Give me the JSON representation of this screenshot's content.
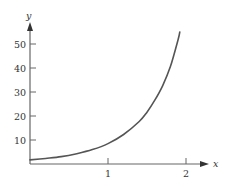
{
  "chart_data": {
    "type": "line",
    "title": "",
    "xlabel": "x",
    "ylabel": "y",
    "xlim": [
      0,
      2.2
    ],
    "ylim": [
      0,
      58
    ],
    "grid": false,
    "legend": null,
    "x_ticks": [
      {
        "value": 1,
        "label": "1"
      },
      {
        "value": 2,
        "label": "2"
      }
    ],
    "y_ticks": [
      {
        "value": 10,
        "label": "10"
      },
      {
        "value": 20,
        "label": "20"
      },
      {
        "value": 30,
        "label": "30"
      },
      {
        "value": 40,
        "label": "40"
      },
      {
        "value": 50,
        "label": "50"
      }
    ],
    "series": [
      {
        "name": "curve",
        "color": "#555555",
        "x": [
          0,
          0.2,
          0.4,
          0.6,
          0.8,
          1.0,
          1.2,
          1.4,
          1.5,
          1.6,
          1.7,
          1.8,
          1.9,
          1.92
        ],
        "y": [
          1.7,
          2.3,
          3.1,
          4.3,
          6.0,
          8.5,
          12.3,
          17.7,
          21.6,
          26.6,
          32.6,
          40.6,
          52.0,
          55.0
        ]
      }
    ]
  },
  "axis_color": "#666666"
}
